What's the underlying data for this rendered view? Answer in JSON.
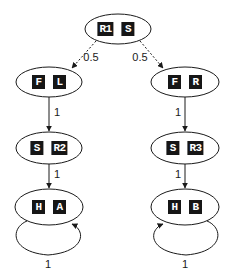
{
  "diagram": {
    "type": "markov-chain",
    "nodes": [
      {
        "id": "start",
        "labels": [
          "R1",
          "S"
        ],
        "cx": 118,
        "cy": 29,
        "rx": 33,
        "ry": 15
      },
      {
        "id": "fl",
        "labels": [
          "F",
          "L"
        ],
        "cx": 49,
        "cy": 82,
        "rx": 33,
        "ry": 15
      },
      {
        "id": "fr",
        "labels": [
          "F",
          "R"
        ],
        "cx": 185,
        "cy": 82,
        "rx": 34,
        "ry": 15
      },
      {
        "id": "sr2",
        "labels": [
          "S",
          "R2"
        ],
        "cx": 49,
        "cy": 148,
        "rx": 33,
        "ry": 16
      },
      {
        "id": "sr3",
        "labels": [
          "S",
          "R3"
        ],
        "cx": 185,
        "cy": 148,
        "rx": 34,
        "ry": 16
      },
      {
        "id": "ha",
        "labels": [
          "H",
          "A"
        ],
        "cx": 49,
        "cy": 207,
        "rx": 34,
        "ry": 18
      },
      {
        "id": "hb",
        "labels": [
          "H",
          "B"
        ],
        "cx": 185,
        "cy": 207,
        "rx": 34,
        "ry": 18
      }
    ],
    "edges": [
      {
        "from": "start",
        "to": "fl",
        "label": "0.5",
        "style": "dotted"
      },
      {
        "from": "start",
        "to": "fr",
        "label": "0.5",
        "style": "dotted"
      },
      {
        "from": "fl",
        "to": "sr2",
        "label": "1",
        "style": "solid"
      },
      {
        "from": "fr",
        "to": "sr3",
        "label": "1",
        "style": "solid"
      },
      {
        "from": "sr2",
        "to": "ha",
        "label": "1",
        "style": "solid"
      },
      {
        "from": "sr3",
        "to": "hb",
        "label": "1",
        "style": "solid"
      },
      {
        "from": "ha",
        "to": "ha",
        "label": "1",
        "style": "self-loop"
      },
      {
        "from": "hb",
        "to": "hb",
        "label": "1",
        "style": "self-loop"
      }
    ],
    "edge_labels": {
      "start_fl": "0.5",
      "start_fr": "0.5",
      "fl_sr2": "1",
      "fr_sr3": "1",
      "sr2_ha": "1",
      "sr3_hb": "1",
      "ha_loop": "1",
      "hb_loop": "1"
    },
    "colors": {
      "stroke": "#1a1a1a",
      "tag_bg": "#161616",
      "tag_text": "#ffffff",
      "background": "#ffffff"
    }
  }
}
